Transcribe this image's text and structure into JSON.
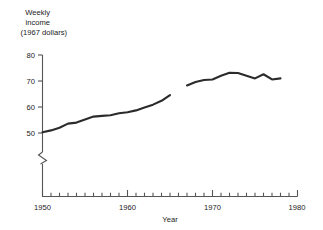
{
  "chart_data": {
    "type": "line",
    "title": "",
    "ylabel_lines": [
      "Weekly",
      "income",
      "(1967 dollars)"
    ],
    "ylabel": "Weekly income (1967 dollars)",
    "xlabel": "Year",
    "xlim": [
      1950,
      1980
    ],
    "ylim": [
      45,
      80
    ],
    "y_axis_break": true,
    "y_axis_break_note": "axis broken below 50",
    "grid": false,
    "legend_position": "none",
    "y_ticks_major": [
      50,
      60,
      70,
      80
    ],
    "y_tick_labels": [
      "50",
      "60",
      "70",
      "80"
    ],
    "x_ticks_major": [
      1950,
      1960,
      1970,
      1980
    ],
    "x_tick_labels": [
      "1950",
      "1960",
      "1970",
      "1980"
    ],
    "x_ticks_minor_step": 1,
    "series": [
      {
        "name": "Weekly income (1967 dollars)",
        "segment": 1,
        "x": [
          1950,
          1951,
          1952,
          1953,
          1954,
          1955,
          1956,
          1957,
          1958,
          1959,
          1960,
          1961,
          1962,
          1963,
          1964,
          1965
        ],
        "values": [
          50.3,
          51.0,
          52.0,
          53.6,
          54.0,
          55.2,
          56.3,
          56.6,
          56.8,
          57.6,
          58.0,
          58.7,
          59.8,
          60.9,
          62.4,
          64.6
        ]
      },
      {
        "name": "Weekly income (1967 dollars)",
        "segment": 2,
        "x": [
          1967,
          1968,
          1969,
          1970,
          1971,
          1972,
          1973,
          1974,
          1975,
          1976,
          1977,
          1978
        ],
        "values": [
          68.3,
          69.6,
          70.4,
          70.6,
          72.0,
          73.2,
          73.1,
          72.0,
          71.0,
          72.6,
          70.6,
          71.0
        ]
      }
    ]
  },
  "axis": {
    "y_title_line1": "Weekly",
    "y_title_line2": "income",
    "y_title_line3": "(1967 dollars)",
    "x_title": "Year"
  },
  "colors": {
    "line": "#2b2b2b",
    "axis": "#555555",
    "text": "#1a1a1a",
    "background": "#ffffff"
  }
}
